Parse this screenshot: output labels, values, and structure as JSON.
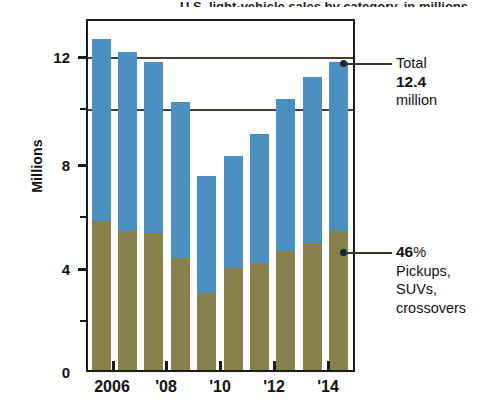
{
  "chart_data": {
    "type": "bar",
    "stacked": true,
    "title": "",
    "xlabel": "",
    "ylabel": "Millions",
    "ylim": [
      0,
      14
    ],
    "yticks_major": [
      0,
      4,
      8,
      12
    ],
    "yticks_minor": [
      2,
      6,
      10
    ],
    "ytick_labels": [
      "0",
      "4",
      "8",
      "12"
    ],
    "grid": true,
    "gridlines_at": [
      12,
      10
    ],
    "categories": [
      "2005",
      "2006",
      "2007",
      "2008",
      "2009",
      "2010",
      "2011",
      "2012",
      "2013",
      "2014"
    ],
    "xtick_labels": [
      "2006",
      "'08",
      "'10",
      "'12",
      "'14"
    ],
    "xtick_categories": [
      "2006",
      "2008",
      "2010",
      "2012",
      "2014"
    ],
    "series": [
      {
        "name": "Pickups, SUVs, crossovers",
        "color": "#87804b",
        "values": [
          6.0,
          5.6,
          5.5,
          4.5,
          3.1,
          4.1,
          4.3,
          4.8,
          5.1,
          5.6
        ]
      },
      {
        "name": "Cars and other",
        "color": "#4a90c2",
        "values": [
          7.3,
          7.2,
          6.9,
          6.3,
          4.7,
          4.5,
          5.2,
          6.1,
          6.7,
          6.8
        ]
      }
    ],
    "totals": [
      13.3,
      12.8,
      12.4,
      10.8,
      7.8,
      8.6,
      9.5,
      10.9,
      11.8,
      12.4
    ],
    "annotations": [
      {
        "id": "total-callout",
        "target_category": "2014",
        "lines": [
          "Total",
          "12.4",
          "million"
        ],
        "value": "12.4",
        "unit": "million",
        "label": "Total"
      },
      {
        "id": "share-callout",
        "target_category": "2014",
        "lines": [
          "46%",
          "Pickups,",
          "SUVs,",
          "crossovers"
        ],
        "value": "46",
        "unit": "%",
        "label": "Pickups, SUVs, crossovers"
      }
    ]
  },
  "axis": {
    "y_title": "Millions",
    "y_labels": [
      "12",
      "8",
      "4",
      "0"
    ],
    "x_labels": [
      "2006",
      "'08",
      "'10",
      "'12",
      "'14"
    ]
  },
  "callouts": {
    "total": {
      "line1": "Total",
      "value": "12.4",
      "line3": "million"
    },
    "share": {
      "value": "46",
      "percent": "%",
      "line2": "Pickups,",
      "line3": "SUVs,",
      "line4": "crossovers"
    }
  },
  "colors": {
    "blue": "#4a90c2",
    "olive": "#87804b",
    "frame": "#1a1a1a",
    "grid": "#4a3b30",
    "dot": "#14233a"
  },
  "title_sliver": "U.S. light-vehicle sales by category, in millions"
}
